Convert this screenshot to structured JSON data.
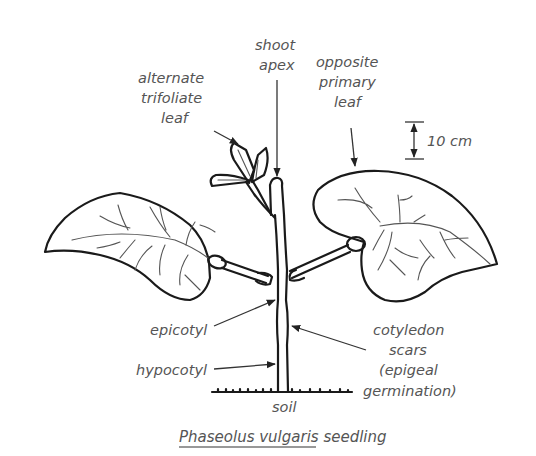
{
  "figure": {
    "caption": {
      "species": "Phaseolus vulgaris",
      "suffix": " seedling"
    },
    "scale_bar": {
      "label": "10 cm"
    },
    "labels": {
      "shoot_apex": [
        "shoot",
        "apex"
      ],
      "alternate_trifoliate_leaf": [
        "alternate",
        "trifoliate",
        "leaf"
      ],
      "opposite_primary_leaf": [
        "opposite",
        "primary",
        "leaf"
      ],
      "epicotyl": [
        "epicotyl"
      ],
      "hypocotyl": [
        "hypocotyl"
      ],
      "cotyledon_scars": [
        "cotyledon",
        "scars",
        "(epigeal",
        "germination)"
      ],
      "soil": [
        "soil"
      ]
    },
    "colors": {
      "line": "#1a1a1a",
      "label_text": "#555555",
      "background": "#ffffff"
    }
  }
}
